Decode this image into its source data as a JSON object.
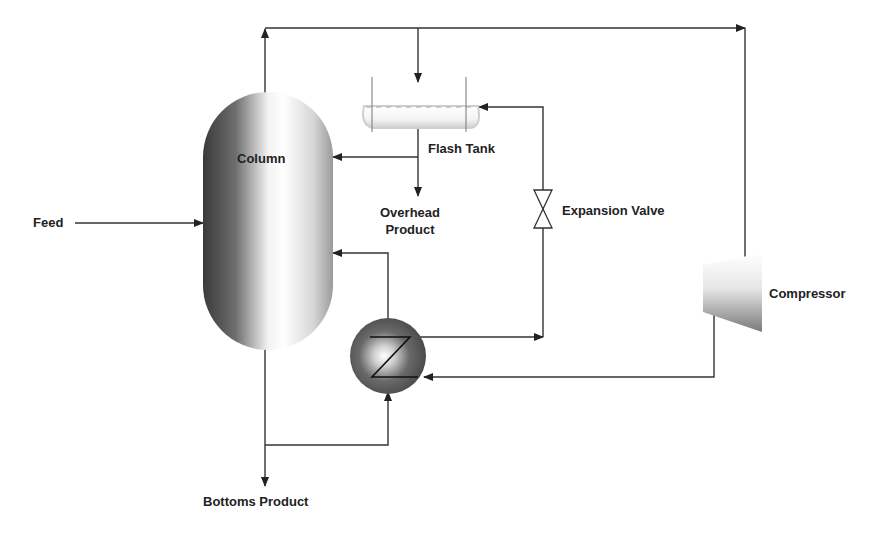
{
  "diagram": {
    "type": "process-flow",
    "line_color": "#333333",
    "components": {
      "column": {
        "label": "Column"
      },
      "flash_tank": {
        "label": "Flash Tank"
      },
      "expansion_valve": {
        "label": "Expansion Valve"
      },
      "compressor": {
        "label": "Compressor"
      },
      "heat_exchanger": {
        "label": ""
      }
    },
    "streams": {
      "feed": {
        "label": "Feed"
      },
      "overhead_product": {
        "line1": "Overhead",
        "line2": "Product"
      },
      "bottoms_product": {
        "label": "Bottoms Product"
      }
    },
    "connections": [
      {
        "from": "Feed",
        "to": "Column"
      },
      {
        "from": "Column (top)",
        "to": "Compressor"
      },
      {
        "from": "Column (top)",
        "to": "Flash Tank"
      },
      {
        "from": "Flash Tank",
        "to": "Column"
      },
      {
        "from": "Flash Tank",
        "to": "Overhead Product"
      },
      {
        "from": "Heat Exchanger",
        "to": "Expansion Valve"
      },
      {
        "from": "Expansion Valve",
        "to": "Flash Tank"
      },
      {
        "from": "Compressor",
        "to": "Heat Exchanger"
      },
      {
        "from": "Heat Exchanger",
        "to": "Column"
      },
      {
        "from": "Column (bottom)",
        "to": "Heat Exchanger"
      },
      {
        "from": "Column (bottom)",
        "to": "Bottoms Product"
      }
    ]
  }
}
